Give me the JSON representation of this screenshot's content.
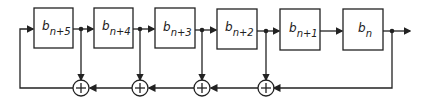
{
  "diagram": {
    "type": "linear feedback shift register",
    "registers": [
      {
        "base": "b",
        "sub": "n+5"
      },
      {
        "base": "b",
        "sub": "n+4"
      },
      {
        "base": "b",
        "sub": "n+3"
      },
      {
        "base": "b",
        "sub": "n+2"
      },
      {
        "base": "b",
        "sub": "n+1"
      },
      {
        "base": "b",
        "sub": "n"
      }
    ],
    "adders": [
      {
        "symbol": "+",
        "tap_after": "n+5"
      },
      {
        "symbol": "+",
        "tap_after": "n+4"
      },
      {
        "symbol": "+",
        "tap_after": "n+3"
      },
      {
        "symbol": "+",
        "tap_after": "n+2"
      }
    ],
    "colors": {
      "line": "#222222",
      "background": "#ffffff"
    }
  }
}
